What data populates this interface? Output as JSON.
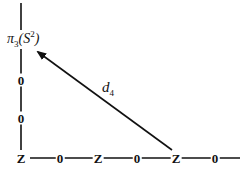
{
  "diagram": {
    "type": "spectral-sequence-page",
    "vertical_axis": {
      "labels": [
        "Z",
        "0",
        "0",
        "π3(S2)"
      ]
    },
    "top_group": {
      "symbol": "π",
      "subscript": "3",
      "space": "S",
      "superscript": "2"
    },
    "bottom_row": [
      "Z",
      "0",
      "Z",
      "0",
      "Z",
      "0"
    ],
    "column_labels": [
      "0",
      "0"
    ],
    "differential": {
      "name": "d",
      "subscript": "4",
      "from": "Z (bottom row, 5th entry)",
      "to": "π3(S2)"
    },
    "colors": {
      "ink": "#111111",
      "background": "#ffffff"
    }
  }
}
